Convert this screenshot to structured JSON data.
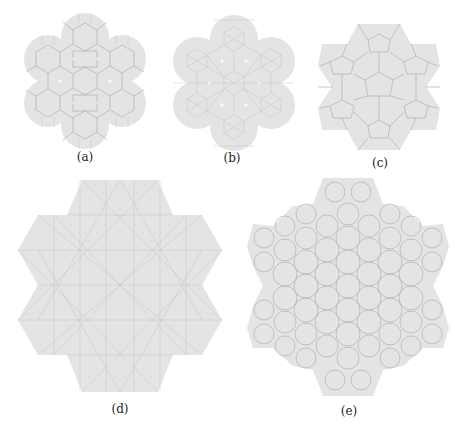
{
  "figure": {
    "panels": [
      {
        "id": "a",
        "label": "(a)",
        "description": "Finite patch of a tiling composed of hexagons, squares and dodecagon-like regions, forming a seven-lobed flower outline"
      },
      {
        "id": "b",
        "label": "(b)",
        "description": "Finite patch of a tiling with triangles, squares and hexagons, forming a seven-lobed flower outline"
      },
      {
        "id": "c",
        "label": "(c)",
        "description": "Finite patch of a pentagonal tiling with a hexagonal star outline"
      },
      {
        "id": "d",
        "label": "(d)",
        "description": "Large patch of a triangle-based tiling with a six-pointed star-hexagon outline"
      },
      {
        "id": "e",
        "label": "(e)",
        "description": "Large patch of a pentagon/hexagon/heptagon tiling with a six-pointed star outline"
      }
    ],
    "colors": {
      "tile_fill": "#e4e4e4",
      "tile_edge": "#b0b0b0",
      "background": "#ffffff",
      "label_text": "#222222"
    }
  }
}
